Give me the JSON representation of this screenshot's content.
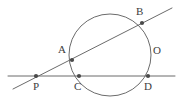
{
  "figure": {
    "canvas": {
      "width": 182,
      "height": 105,
      "background": "#ffffff"
    },
    "stroke_color": "#6b6b6b",
    "point_color": "#4a4a4a",
    "label_color": "#3d3d3d",
    "circle": {
      "name": "main-circle",
      "center_x": 110,
      "center_y": 55,
      "radius": 41
    },
    "lines": [
      {
        "name": "secant-pcd",
        "description": "horizontal secant through P, C and D",
        "x1": 8,
        "y1": 76,
        "x2": 175,
        "y2": 76
      },
      {
        "name": "secant-pab",
        "description": "oblique secant through P, A and B",
        "x1": 13,
        "y1": 89,
        "x2": 172,
        "y2": 8
      }
    ],
    "points": [
      {
        "id": "P",
        "label": "P",
        "x": 36,
        "y": 76,
        "label_x": 33,
        "label_y": 81,
        "role": "external-intersection"
      },
      {
        "id": "C",
        "label": "C",
        "x": 79,
        "y": 76,
        "label_x": 74,
        "label_y": 81,
        "role": "circle-intersection"
      },
      {
        "id": "D",
        "label": "D",
        "x": 148,
        "y": 76,
        "label_x": 144,
        "label_y": 81,
        "role": "circle-intersection"
      },
      {
        "id": "A",
        "label": "A",
        "x": 72,
        "y": 60,
        "label_x": 58,
        "label_y": 44,
        "role": "circle-intersection"
      },
      {
        "id": "B",
        "label": "B",
        "x": 142,
        "y": 23,
        "label_x": 136,
        "label_y": 6,
        "role": "circle-intersection"
      }
    ],
    "labels": [
      {
        "id": "O",
        "label": "O",
        "label_x": 153,
        "label_y": 45,
        "role": "circle-name-label"
      }
    ]
  }
}
